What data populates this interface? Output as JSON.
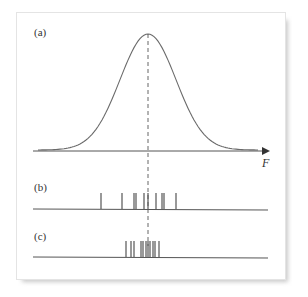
{
  "panels": {
    "a": {
      "label": "(a)"
    },
    "b": {
      "label": "(b)"
    },
    "c": {
      "label": "(c)"
    }
  },
  "axis": {
    "label": "F"
  },
  "colors": {
    "curve": "#6a6a6a",
    "axis": "#555555",
    "ticks": "#555555",
    "dashed": "#666666"
  },
  "chart_data": {
    "type": "diagram",
    "title": "",
    "panel_a": {
      "type": "line",
      "curve": "gaussian",
      "mean_x": 148,
      "sigma_px": 28,
      "xlabel": "F"
    },
    "panel_b": {
      "type": "rug",
      "tick_x": [
        101,
        122,
        134,
        136,
        144,
        148,
        156,
        162,
        164,
        176
      ]
    },
    "panel_c": {
      "type": "rug",
      "tick_x": [
        126,
        131,
        134,
        141,
        143,
        146,
        148,
        150,
        153,
        155,
        159
      ]
    }
  }
}
